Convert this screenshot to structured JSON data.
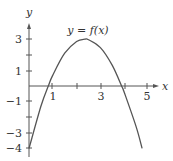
{
  "chart_data": {
    "type": "line",
    "title": "y = f(x)",
    "xlabel": "x",
    "ylabel": "y",
    "xlim": [
      0,
      5.4
    ],
    "ylim": [
      -4.2,
      3.8
    ],
    "x_ticks": [
      1,
      2,
      3,
      4,
      5
    ],
    "x_tick_labels": [
      "1",
      "3",
      "5"
    ],
    "y_ticks": [
      3,
      2,
      1,
      -1,
      -2,
      -3,
      -4
    ],
    "y_tick_labels": [
      "3",
      "1",
      "-1",
      "-3",
      "-4"
    ],
    "grid": false,
    "series": [
      {
        "name": "y = f(x)",
        "x": [
          0,
          0.5,
          0.81,
          1,
          1.5,
          2,
          2.35,
          2.5,
          3,
          3.5,
          3.89,
          4,
          4.5,
          4.75
        ],
        "y": [
          -4,
          -1.3,
          0,
          0.7,
          2.1,
          2.85,
          3,
          2.97,
          2.46,
          1.32,
          0,
          -0.4,
          -2.6,
          -4
        ]
      }
    ],
    "curve_label": "y = f(x)"
  },
  "axes": {
    "x_label": "x",
    "y_label": "y",
    "x_tick_text": {
      "1": "1",
      "3": "3",
      "5": "5"
    },
    "y_tick_text": {
      "3": "3",
      "1": "1",
      "-1": "−1",
      "-3": "−3",
      "-4": "−4"
    }
  },
  "colors": {
    "curve": "#555555",
    "axes": "#555555",
    "text": "#333333"
  }
}
